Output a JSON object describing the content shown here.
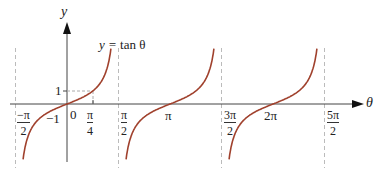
{
  "chart_data": {
    "type": "line",
    "title": "y = tan θ",
    "xlabel": "θ",
    "ylabel": "y",
    "function": "tan",
    "x_tick_labels": [
      "-π/2",
      "0",
      "π/4",
      "π/2",
      "π",
      "3π/2",
      "2π",
      "5π/2"
    ],
    "y_tick_labels": [
      "1",
      "-1"
    ],
    "asymptotes": [
      "-π/2",
      "π/2",
      "3π/2",
      "5π/2"
    ],
    "branches": [
      {
        "domain": [
          "-π/2",
          "π/2"
        ],
        "zero": "0"
      },
      {
        "domain": [
          "π/2",
          "3π/2"
        ],
        "zero": "π"
      },
      {
        "domain": [
          "3π/2",
          "5π/2"
        ],
        "zero": "2π"
      }
    ],
    "highlight_point": {
      "x": "π/4",
      "y": 1
    },
    "grid": false,
    "curve_color": "#a0412d"
  },
  "labels": {
    "y_axis": "y",
    "x_axis": "θ",
    "equation_lhs": "y =",
    "equation_rhs": "tan θ",
    "one": "1",
    "minus_one": "−1",
    "zero": "0",
    "pi": "π",
    "two_pi": "2π",
    "neg_pi_num": "−π",
    "pi_num": "π",
    "three_pi_num": "3π",
    "five_pi_num": "5π",
    "den2": "2",
    "den4": "4"
  }
}
